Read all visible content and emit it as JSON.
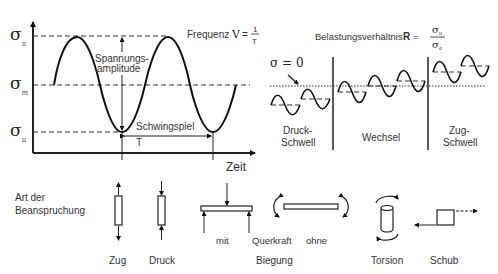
{
  "main_graph": {
    "y_labels": {
      "sigma": "σ",
      "upper_sub": "o",
      "mean_sub": "m",
      "lower_sub": "u"
    },
    "amplitude_label_1": "Spannungs-",
    "amplitude_label_2": "amplitude",
    "cycle_label": "Schwingspiel",
    "period_label": "T",
    "x_axis_label": "Zeit"
  },
  "frequency": {
    "label": "Frequenz",
    "symbol": "V",
    "eq": "=",
    "num": "1",
    "den": "T"
  },
  "ratio": {
    "label": "Belastungsverhältnis",
    "symbol": "R",
    "eq": "=",
    "num_sigma": "σ",
    "num_sub": "u",
    "den_sigma": "σ",
    "den_sub": "o"
  },
  "stress_types": {
    "zero_label": "σ = 0",
    "columns": [
      {
        "line1": "Druck-",
        "line2": "Schwell"
      },
      {
        "line1": "Wechsel"
      },
      {
        "line1": "Zug-",
        "line2": "Schwell"
      }
    ]
  },
  "loading": {
    "title_1": "Art der",
    "title_2": "Beanspruchung",
    "items": [
      {
        "label": "Zug"
      },
      {
        "label": "Druck"
      },
      {
        "label": "mit"
      },
      {
        "label": "Querkraft"
      },
      {
        "label": "ohne"
      },
      {
        "label": "Biegung"
      },
      {
        "label": "Torsion"
      },
      {
        "label": "Schub"
      }
    ]
  }
}
